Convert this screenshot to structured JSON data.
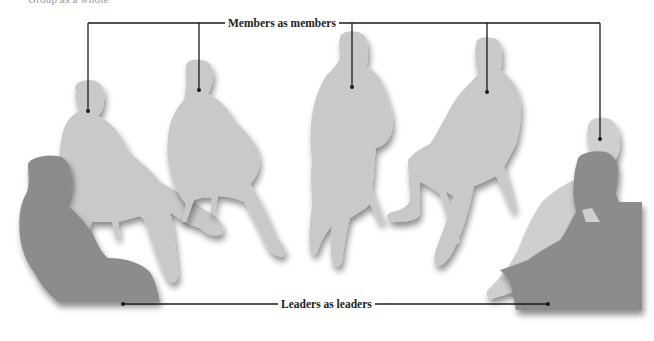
{
  "header": {
    "cut_title": "Group as a whole"
  },
  "labels": {
    "members": "Members as members",
    "leaders": "Leaders as leaders"
  },
  "figures": {
    "members": [
      {
        "id": "member-1",
        "role": "member",
        "pointer": [
          88,
          111
        ]
      },
      {
        "id": "member-2",
        "role": "member",
        "pointer": [
          199,
          90
        ]
      },
      {
        "id": "member-3",
        "role": "member",
        "pointer": [
          352,
          87
        ]
      },
      {
        "id": "member-4",
        "role": "member",
        "pointer": [
          487,
          92
        ]
      },
      {
        "id": "member-5",
        "role": "member",
        "pointer": [
          600,
          139
        ]
      }
    ],
    "leaders": [
      {
        "id": "leader-left",
        "role": "leader",
        "pointer": [
          123,
          304
        ]
      },
      {
        "id": "leader-right",
        "role": "leader",
        "pointer": [
          548,
          304
        ]
      }
    ]
  },
  "colors": {
    "member_fill": "#c9c9c9",
    "leader_fill": "#8c8c8c",
    "line": "#1a1a1a",
    "background": "#ffffff"
  }
}
